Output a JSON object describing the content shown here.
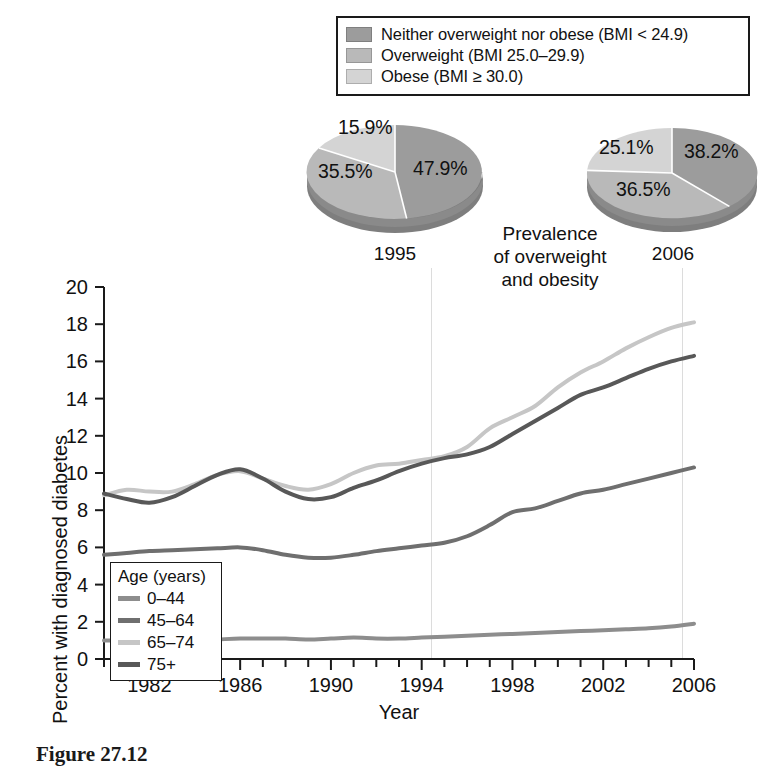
{
  "bmi_legend": {
    "items": [
      {
        "label": "Neither overweight nor obese (BMI < 24.9)",
        "color": "#9c9c9c"
      },
      {
        "label": "Overweight (BMI 25.0–29.9)",
        "color": "#b9b9b9"
      },
      {
        "label": "Obese (BMI ≥ 30.0)",
        "color": "#d4d4d4"
      }
    ]
  },
  "prevalence_caption": {
    "line1": "Prevalence",
    "line2": "of overweight",
    "line3": "and obesity"
  },
  "figure_caption": "Figure 27.12",
  "chart_data": [
    {
      "type": "pie",
      "title": "1995",
      "labels": [
        "Neither overweight nor obese (BMI < 24.9)",
        "Overweight (BMI 25.0–29.9)",
        "Obese (BMI ≥ 30.0)"
      ],
      "values": [
        47.9,
        35.5,
        15.9
      ],
      "display_values": [
        "47.9%",
        "35.5%",
        "15.9%"
      ],
      "colors": [
        "#9c9c9c",
        "#b9b9b9",
        "#d4d4d4"
      ]
    },
    {
      "type": "pie",
      "title": "2006",
      "labels": [
        "Neither overweight nor obese (BMI < 24.9)",
        "Overweight (BMI 25.0–29.9)",
        "Obese (BMI ≥ 30.0)"
      ],
      "values": [
        38.2,
        36.5,
        25.1
      ],
      "display_values": [
        "38.2%",
        "36.5%",
        "25.1%"
      ],
      "colors": [
        "#9c9c9c",
        "#b9b9b9",
        "#d4d4d4"
      ]
    },
    {
      "type": "line",
      "title": "",
      "xlabel": "Year",
      "ylabel": "Percent with diagnosed diabetes",
      "xlim": [
        1980,
        2006
      ],
      "ylim": [
        0,
        20
      ],
      "yticks": [
        0,
        2,
        4,
        6,
        8,
        10,
        12,
        14,
        16,
        18,
        20
      ],
      "xticks": [
        1982,
        1986,
        1990,
        1994,
        1998,
        2002,
        2006
      ],
      "grid": false,
      "legend_title": "Age (years)",
      "legend_position": "upper-left-inside",
      "x": [
        1980,
        1981,
        1982,
        1983,
        1984,
        1985,
        1986,
        1987,
        1988,
        1989,
        1990,
        1991,
        1992,
        1993,
        1994,
        1995,
        1996,
        1997,
        1998,
        1999,
        2000,
        2001,
        2002,
        2003,
        2004,
        2005,
        2006
      ],
      "series": [
        {
          "name": "0–44",
          "color": "#8d8d8d",
          "values": [
            1.0,
            1.0,
            1.0,
            1.0,
            1.0,
            1.05,
            1.1,
            1.1,
            1.1,
            1.05,
            1.1,
            1.15,
            1.1,
            1.1,
            1.15,
            1.2,
            1.25,
            1.3,
            1.35,
            1.4,
            1.45,
            1.5,
            1.55,
            1.6,
            1.65,
            1.75,
            1.9
          ]
        },
        {
          "name": "45–64",
          "color": "#6f6f6f",
          "values": [
            5.6,
            5.7,
            5.8,
            5.85,
            5.9,
            5.95,
            6.0,
            5.85,
            5.6,
            5.45,
            5.45,
            5.6,
            5.8,
            5.95,
            6.1,
            6.25,
            6.6,
            7.2,
            7.9,
            8.1,
            8.5,
            8.9,
            9.1,
            9.4,
            9.7,
            10.0,
            10.3
          ]
        },
        {
          "name": "65–74",
          "color": "#c6c6c6",
          "values": [
            8.8,
            9.1,
            9.0,
            9.0,
            9.4,
            9.9,
            10.1,
            9.7,
            9.3,
            9.1,
            9.4,
            10.0,
            10.4,
            10.5,
            10.7,
            10.9,
            11.4,
            12.4,
            13.0,
            13.6,
            14.6,
            15.4,
            16.0,
            16.7,
            17.3,
            17.8,
            18.1
          ]
        },
        {
          "name": "75+",
          "color": "#585858",
          "values": [
            8.9,
            8.6,
            8.4,
            8.7,
            9.3,
            9.9,
            10.2,
            9.7,
            9.0,
            8.6,
            8.7,
            9.2,
            9.6,
            10.1,
            10.5,
            10.8,
            11.0,
            11.4,
            12.1,
            12.8,
            13.5,
            14.2,
            14.6,
            15.1,
            15.6,
            16.0,
            16.3
          ]
        }
      ]
    }
  ]
}
